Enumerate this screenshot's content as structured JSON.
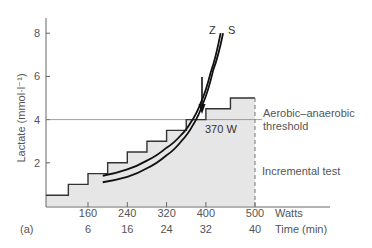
{
  "chart_data": {
    "type": "line",
    "title": "",
    "panel_label": "(a)",
    "ylabel": "Lactate (mmol·l⁻¹)",
    "xlabel": "Watts",
    "xlabel_secondary": "Time (min)",
    "ylim": [
      0,
      8.5
    ],
    "xlim": [
      80,
      580
    ],
    "y_ticks": [
      "2",
      "4",
      "6",
      "8"
    ],
    "y_tick_values": [
      2,
      4,
      6,
      8
    ],
    "x_ticks": [
      "160",
      "240",
      "320",
      "400",
      "500"
    ],
    "x_tick_values": [
      160,
      240,
      320,
      400,
      500
    ],
    "x_ticks_secondary": [
      "6",
      "16",
      "24",
      "32",
      "40"
    ],
    "grid": false,
    "threshold": {
      "value": 4,
      "label_line1": "Aerobic–anaerobic",
      "label_line2": "threshold"
    },
    "threshold_power": {
      "value": 370,
      "label": "370 W"
    },
    "staircase": {
      "name": "Incremental test",
      "label": "Incremental test",
      "steps": [
        {
          "x_start": 80,
          "x_end": 120,
          "y": 0.5
        },
        {
          "x_start": 120,
          "x_end": 160,
          "y": 1.0
        },
        {
          "x_start": 160,
          "x_end": 200,
          "y": 1.5
        },
        {
          "x_start": 200,
          "x_end": 240,
          "y": 2.0
        },
        {
          "x_start": 240,
          "x_end": 280,
          "y": 2.5
        },
        {
          "x_start": 280,
          "x_end": 320,
          "y": 3.0
        },
        {
          "x_start": 320,
          "x_end": 360,
          "y": 3.5
        },
        {
          "x_start": 360,
          "x_end": 400,
          "y": 4.0
        },
        {
          "x_start": 400,
          "x_end": 450,
          "y": 4.5
        },
        {
          "x_start": 450,
          "x_end": 500,
          "y": 5.0
        }
      ]
    },
    "series": [
      {
        "name": "Z",
        "label": "Z",
        "x": [
          190,
          240,
          280,
          320,
          350,
          370,
          390,
          410,
          430
        ],
        "y": [
          1.4,
          1.7,
          2.1,
          2.7,
          3.3,
          3.9,
          4.8,
          6.2,
          8.0
        ]
      },
      {
        "name": "S",
        "label": "S",
        "x": [
          190,
          240,
          280,
          320,
          350,
          375,
          395,
          415,
          435
        ],
        "y": [
          1.1,
          1.35,
          1.75,
          2.35,
          3.0,
          3.8,
          4.8,
          6.3,
          8.0
        ]
      }
    ],
    "legend": "inline labels at curve tops"
  }
}
